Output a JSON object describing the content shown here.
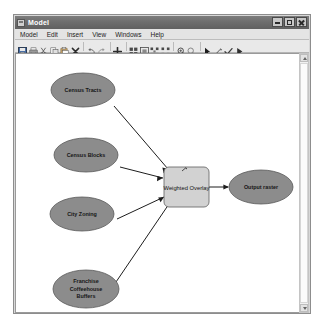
{
  "window": {
    "title": "Model",
    "icon": "model-icon",
    "controls": [
      {
        "name": "minimize-button",
        "label": "Minimize"
      },
      {
        "name": "maximize-button",
        "label": "Maximize"
      },
      {
        "name": "close-button",
        "label": "Close"
      }
    ]
  },
  "menu": {
    "items": [
      {
        "label": "Model"
      },
      {
        "label": "Edit"
      },
      {
        "label": "Insert"
      },
      {
        "label": "View"
      },
      {
        "label": "Windows"
      },
      {
        "label": "Help"
      }
    ]
  },
  "toolbar": {
    "icons": [
      {
        "name": "save-icon"
      },
      {
        "name": "print-icon"
      },
      {
        "name": "cut-icon"
      },
      {
        "name": "copy-icon"
      },
      {
        "name": "paste-icon"
      },
      {
        "name": "delete-icon"
      },
      {
        "name": "undo-icon"
      },
      {
        "name": "redo-icon"
      },
      {
        "name": "add-data-icon"
      },
      {
        "name": "auto-layout-icon"
      },
      {
        "name": "full-extent-icon"
      },
      {
        "name": "validate-icon"
      },
      {
        "name": "diagram-properties-icon"
      },
      {
        "name": "zoom-in-icon"
      },
      {
        "name": "zoom-out-icon"
      },
      {
        "name": "select-pointer-icon"
      },
      {
        "name": "connect-icon"
      },
      {
        "name": "run-check-icon"
      },
      {
        "name": "run-icon"
      }
    ]
  },
  "diagram": {
    "inputs": [
      {
        "name": "census-tracts",
        "label": "Census Tracts",
        "lines": [
          "Census Tracts"
        ]
      },
      {
        "name": "census-blocks",
        "label": "Census Blocks",
        "lines": [
          "Census Blocks"
        ]
      },
      {
        "name": "city-zoning",
        "label": "City Zoning",
        "lines": [
          "City Zoning"
        ]
      },
      {
        "name": "franchise-coffeehouse-buffers",
        "label": "Franchise Coffeehouse Buffers",
        "lines": [
          "Franchise",
          "Coffeehouse",
          "Buffers"
        ]
      }
    ],
    "tool": {
      "name": "weighted-overlay",
      "label": "Weighted Overlay"
    },
    "output": {
      "name": "output-raster",
      "label": "Output raster"
    },
    "colors": {
      "input_fill": "#8c8c8c",
      "input_stroke": "#5a5a5a",
      "tool_fill": "#d2d2d2",
      "tool_stroke": "#6e6e6e",
      "output_fill": "#8c8c8c",
      "output_stroke": "#5a5a5a",
      "connector": "#1d1d1d",
      "canvas_bg": "#ffffff"
    }
  },
  "scrollbar": {
    "name": "vertical-scrollbar",
    "up_label": "Scroll up",
    "down_label": "Scroll down"
  }
}
